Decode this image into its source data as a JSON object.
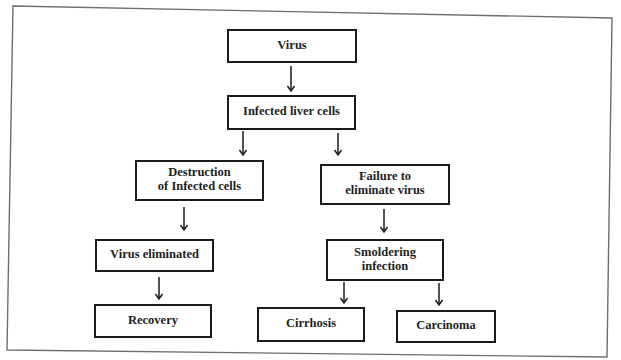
{
  "diagram": {
    "type": "flowchart",
    "title": "",
    "colors": {
      "background": "#ffffff",
      "frame": "#6e6e6e",
      "box_border": "#1a1a1a",
      "text": "#1e1e1e"
    },
    "frame": {
      "points": [
        [
          13,
          6
        ],
        [
          612,
          18
        ],
        [
          607,
          357
        ],
        [
          7,
          350
        ]
      ]
    },
    "nodes": [
      {
        "id": "virus",
        "lines": [
          "Virus"
        ],
        "x": 228,
        "y": 30,
        "w": 128,
        "h": 32
      },
      {
        "id": "infected_liver_cells",
        "lines": [
          "Infected liver cells"
        ],
        "x": 228,
        "y": 96,
        "w": 127,
        "h": 33
      },
      {
        "id": "destruction_infected_cells",
        "lines": [
          "Destruction",
          "of Infected cells"
        ],
        "x": 136,
        "y": 161,
        "w": 127,
        "h": 39
      },
      {
        "id": "failure_eliminate_virus",
        "lines": [
          "Failure to",
          "eliminate virus"
        ],
        "x": 321,
        "y": 165,
        "w": 128,
        "h": 39
      },
      {
        "id": "virus_eliminated",
        "lines": [
          "Virus eliminated"
        ],
        "x": 96,
        "y": 240,
        "w": 117,
        "h": 31
      },
      {
        "id": "smoldering_infection",
        "lines": [
          "Smoldering",
          "infection"
        ],
        "x": 327,
        "y": 240,
        "w": 116,
        "h": 40
      },
      {
        "id": "recovery",
        "lines": [
          "Recovery"
        ],
        "x": 95,
        "y": 305,
        "w": 116,
        "h": 32
      },
      {
        "id": "cirrhosis",
        "lines": [
          "Cirrhosis"
        ],
        "x": 258,
        "y": 308,
        "w": 106,
        "h": 33
      },
      {
        "id": "carcinoma",
        "lines": [
          "Carcinoma"
        ],
        "x": 397,
        "y": 311,
        "w": 98,
        "h": 31
      }
    ],
    "edges": [
      {
        "from": "virus",
        "to": "infected_liver_cells",
        "x": 291,
        "y1": 66,
        "y2": 91
      },
      {
        "from": "infected_liver_cells",
        "to": "destruction_infected_cells",
        "x": 243,
        "y1": 131,
        "y2": 155
      },
      {
        "from": "infected_liver_cells",
        "to": "failure_eliminate_virus",
        "x": 338,
        "y1": 133,
        "y2": 155
      },
      {
        "from": "destruction_infected_cells",
        "to": "virus_eliminated",
        "x": 184,
        "y1": 207,
        "y2": 230
      },
      {
        "from": "failure_eliminate_virus",
        "to": "smoldering_infection",
        "x": 384,
        "y1": 209,
        "y2": 232
      },
      {
        "from": "virus_eliminated",
        "to": "recovery",
        "x": 159,
        "y1": 277,
        "y2": 299
      },
      {
        "from": "smoldering_infection",
        "to": "cirrhosis",
        "x": 344,
        "y1": 282,
        "y2": 303
      },
      {
        "from": "smoldering_infection",
        "to": "carcinoma",
        "x": 439,
        "y1": 283,
        "y2": 305
      }
    ]
  }
}
